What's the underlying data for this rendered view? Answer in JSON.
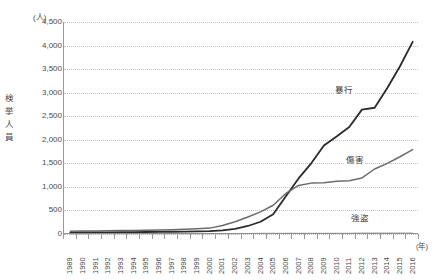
{
  "chart_data": {
    "type": "line",
    "title": "",
    "xlabel": "(年)",
    "ylabel": "検挙人員",
    "yunit": "(人)",
    "ylim": [
      0,
      4500
    ],
    "ytick_step": 500,
    "grid": true,
    "legend_position": "inline-labels",
    "ytick_labels": [
      "4,500",
      "4,000",
      "3,500",
      "3,000",
      "2,500",
      "2,000",
      "1,500",
      "1,000",
      "500",
      "0"
    ],
    "ytick_values": [
      4500,
      4000,
      3500,
      3000,
      2500,
      2000,
      1500,
      1000,
      500,
      0
    ],
    "categories": [
      "1989",
      "1990",
      "1991",
      "1992",
      "1993",
      "1994",
      "1995",
      "1996",
      "1997",
      "1998",
      "1999",
      "2000",
      "2001",
      "2002",
      "2003",
      "2004",
      "2005",
      "2006",
      "2007",
      "2008",
      "2009",
      "2010",
      "2011",
      "2012",
      "2013",
      "2014",
      "2015",
      "2016"
    ],
    "series": [
      {
        "name": "暴行",
        "color": "#2b2b2b",
        "width": 1.8,
        "label_x_year": "2011",
        "values": [
          30,
          32,
          35,
          35,
          38,
          40,
          42,
          45,
          48,
          50,
          55,
          60,
          75,
          110,
          170,
          260,
          420,
          800,
          1180,
          1500,
          1880,
          2070,
          2270,
          2640,
          2680,
          3100,
          3560,
          4080
        ]
      },
      {
        "name": "傷害",
        "color": "#6b6b6b",
        "width": 1.5,
        "label_x_year": "2012",
        "values": [
          60,
          62,
          66,
          68,
          72,
          76,
          80,
          86,
          92,
          100,
          110,
          125,
          180,
          260,
          360,
          470,
          610,
          860,
          1030,
          1080,
          1090,
          1120,
          1130,
          1190,
          1380,
          1500,
          1640,
          1790
        ]
      },
      {
        "name": "強盗",
        "color": "#a8a8a8",
        "width": 1.2,
        "label_x_year": "2013",
        "values": [
          4,
          4,
          5,
          5,
          5,
          6,
          6,
          6,
          7,
          7,
          8,
          8,
          9,
          10,
          11,
          12,
          13,
          14,
          14,
          15,
          15,
          16,
          16,
          17,
          17,
          18,
          18,
          19
        ]
      }
    ]
  }
}
